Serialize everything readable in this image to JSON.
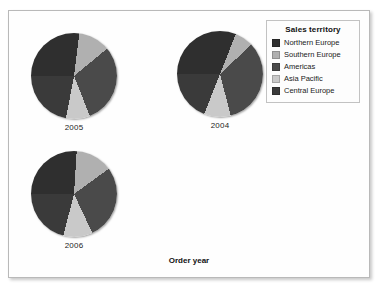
{
  "panel": {
    "axis_label": "Order year",
    "background": "#fefefe",
    "border_color": "#b9b9b9"
  },
  "legend": {
    "title": "Sales territory",
    "position": "top-right",
    "items": [
      {
        "label": "Northern Europe",
        "color": "#2f2f2f"
      },
      {
        "label": "Southern Europe",
        "color": "#b0b0b0"
      },
      {
        "label": "Americas",
        "color": "#4a4a4a"
      },
      {
        "label": "Asia Pacific",
        "color": "#c9c9c9"
      },
      {
        "label": "Central Europe",
        "color": "#3a3a3a"
      }
    ]
  },
  "pies": [
    {
      "label": "2005",
      "name": "pie-2005"
    },
    {
      "label": "2004",
      "name": "pie-2004"
    },
    {
      "label": "2006",
      "name": "pie-2006"
    }
  ],
  "chart_data": {
    "type": "pie",
    "title": "",
    "xlabel": "Order year",
    "ylabel": "",
    "legend_title": "Sales territory",
    "legend_position": "top-right",
    "grid": false,
    "categories": [
      "Northern Europe",
      "Southern Europe",
      "Americas",
      "Asia Pacific",
      "Central Europe"
    ],
    "colors": [
      "#2f2f2f",
      "#b0b0b0",
      "#4a4a4a",
      "#c9c9c9",
      "#3a3a3a"
    ],
    "panels": [
      {
        "label": "2005",
        "values": [
          27,
          12,
          30,
          9,
          22
        ],
        "slices": [
          {
            "category": "Northern Europe",
            "value": 27
          },
          {
            "category": "Southern Europe",
            "value": 12
          },
          {
            "category": "Americas",
            "value": 30
          },
          {
            "category": "Asia Pacific",
            "value": 9
          },
          {
            "category": "Central Europe",
            "value": 22
          }
        ]
      },
      {
        "label": "2004",
        "values": [
          31,
          7,
          33,
          10,
          19
        ],
        "slices": [
          {
            "category": "Northern Europe",
            "value": 31
          },
          {
            "category": "Southern Europe",
            "value": 7
          },
          {
            "category": "Americas",
            "value": 33
          },
          {
            "category": "Asia Pacific",
            "value": 10
          },
          {
            "category": "Central Europe",
            "value": 19
          }
        ]
      },
      {
        "label": "2006",
        "values": [
          26,
          14,
          28,
          11,
          21
        ],
        "slices": [
          {
            "category": "Northern Europe",
            "value": 26
          },
          {
            "category": "Southern Europe",
            "value": 14
          },
          {
            "category": "Americas",
            "value": 28
          },
          {
            "category": "Asia Pacific",
            "value": 11
          },
          {
            "category": "Central Europe",
            "value": 21
          }
        ]
      }
    ]
  }
}
